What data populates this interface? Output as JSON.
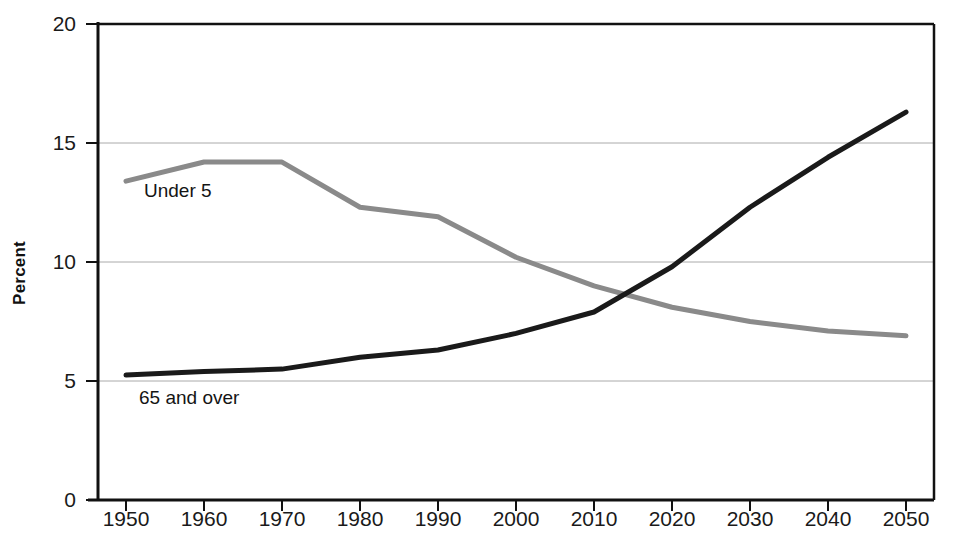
{
  "chart_data": {
    "type": "line",
    "title": "",
    "xlabel": "",
    "ylabel": "Percent",
    "xlim": [
      1945,
      2055
    ],
    "ylim": [
      0,
      20
    ],
    "grid": true,
    "grid_axis": "y",
    "legend": "inline-annotations",
    "x": [
      1950,
      1960,
      1970,
      1980,
      1990,
      2000,
      2010,
      2020,
      2030,
      2040,
      2050
    ],
    "xticks": [
      "1950",
      "1960",
      "1970",
      "1980",
      "1990",
      "2000",
      "2010",
      "2020",
      "2030",
      "2040",
      "2050"
    ],
    "yticks": [
      "0",
      "5",
      "10",
      "15",
      "20"
    ],
    "ytick_values": [
      0,
      5,
      10,
      15,
      20
    ],
    "series": [
      {
        "name": "Under 5",
        "color": "#8a8a8a",
        "values": [
          13.4,
          14.2,
          14.2,
          12.3,
          11.9,
          10.2,
          9.0,
          8.1,
          7.5,
          7.1,
          6.9
        ]
      },
      {
        "name": "65 and over",
        "color": "#1a1a1a",
        "values": [
          5.25,
          5.4,
          5.5,
          6.0,
          6.3,
          7.0,
          7.9,
          9.8,
          12.3,
          14.4,
          16.3
        ]
      }
    ],
    "annotations": [
      {
        "text": "Under 5",
        "x_px": 144,
        "y_px": 181
      },
      {
        "text": "65 and over",
        "x_px": 139,
        "y_px": 388
      }
    ]
  },
  "axis": {
    "y_title": "Percent"
  },
  "colors": {
    "under5": "#8a8a8a",
    "over65": "#1a1a1a",
    "grid": "#aaaaaa",
    "axis": "#111111",
    "background": "#ffffff"
  }
}
